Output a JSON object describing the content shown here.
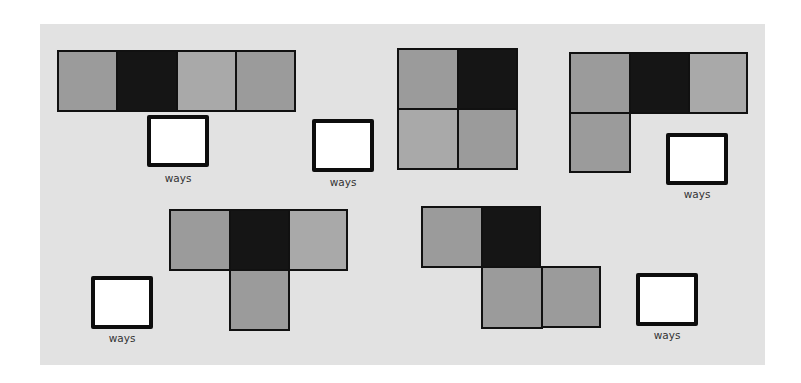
{
  "colors": {
    "background": "#e2e2e2",
    "dark": "#151515",
    "medium": "#9b9b9b",
    "light": "#a9a9a9",
    "answer_box": "#ffffff",
    "border": "#111111"
  },
  "cell_size": 60,
  "shapes": [
    {
      "id": "shape-1-straight",
      "cells": [
        {
          "x": 57,
          "y": 50,
          "w": 61,
          "h": 62,
          "tone": "medium"
        },
        {
          "x": 116,
          "y": 50,
          "w": 62,
          "h": 62,
          "tone": "dark"
        },
        {
          "x": 176,
          "y": 50,
          "w": 61,
          "h": 62,
          "tone": "light"
        },
        {
          "x": 235,
          "y": 50,
          "w": 61,
          "h": 62,
          "tone": "medium"
        }
      ]
    },
    {
      "id": "shape-2-square",
      "cells": [
        {
          "x": 397,
          "y": 48,
          "w": 62,
          "h": 62,
          "tone": "medium"
        },
        {
          "x": 457,
          "y": 48,
          "w": 61,
          "h": 62,
          "tone": "dark"
        },
        {
          "x": 397,
          "y": 108,
          "w": 62,
          "h": 62,
          "tone": "light"
        },
        {
          "x": 457,
          "y": 108,
          "w": 61,
          "h": 62,
          "tone": "medium"
        }
      ]
    },
    {
      "id": "shape-3-l",
      "cells": [
        {
          "x": 569,
          "y": 52,
          "w": 62,
          "h": 62,
          "tone": "medium"
        },
        {
          "x": 629,
          "y": 52,
          "w": 61,
          "h": 62,
          "tone": "dark"
        },
        {
          "x": 688,
          "y": 52,
          "w": 60,
          "h": 62,
          "tone": "light"
        },
        {
          "x": 569,
          "y": 112,
          "w": 62,
          "h": 61,
          "tone": "medium"
        }
      ]
    },
    {
      "id": "shape-4-t",
      "cells": [
        {
          "x": 169,
          "y": 209,
          "w": 62,
          "h": 62,
          "tone": "medium"
        },
        {
          "x": 229,
          "y": 209,
          "w": 61,
          "h": 62,
          "tone": "dark"
        },
        {
          "x": 288,
          "y": 209,
          "w": 60,
          "h": 62,
          "tone": "light"
        },
        {
          "x": 229,
          "y": 269,
          "w": 61,
          "h": 62,
          "tone": "medium"
        }
      ]
    },
    {
      "id": "shape-5-s",
      "cells": [
        {
          "x": 421,
          "y": 206,
          "w": 62,
          "h": 62,
          "tone": "medium"
        },
        {
          "x": 481,
          "y": 206,
          "w": 60,
          "h": 62,
          "tone": "dark"
        },
        {
          "x": 481,
          "y": 266,
          "w": 62,
          "h": 63,
          "tone": "medium"
        },
        {
          "x": 541,
          "y": 266,
          "w": 60,
          "h": 62,
          "tone": "medium"
        }
      ]
    }
  ],
  "answers": [
    {
      "id": "answer-1",
      "box": {
        "x": 147,
        "y": 115,
        "w": 62,
        "h": 52
      },
      "label": "ways",
      "label_pos": {
        "x": 148,
        "y": 172
      }
    },
    {
      "id": "answer-2",
      "box": {
        "x": 312,
        "y": 119,
        "w": 62,
        "h": 53
      },
      "label": "ways",
      "label_pos": {
        "x": 313,
        "y": 176
      }
    },
    {
      "id": "answer-3",
      "box": {
        "x": 666,
        "y": 133,
        "w": 62,
        "h": 52
      },
      "label": "ways",
      "label_pos": {
        "x": 667,
        "y": 188
      }
    },
    {
      "id": "answer-4",
      "box": {
        "x": 91,
        "y": 276,
        "w": 62,
        "h": 53
      },
      "label": "ways",
      "label_pos": {
        "x": 92,
        "y": 332
      }
    },
    {
      "id": "answer-5",
      "box": {
        "x": 636,
        "y": 273,
        "w": 62,
        "h": 53
      },
      "label": "ways",
      "label_pos": {
        "x": 637,
        "y": 329
      }
    }
  ]
}
